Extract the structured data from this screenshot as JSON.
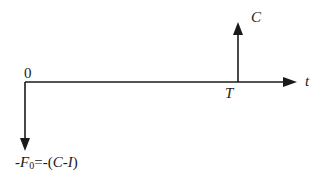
{
  "diagram": {
    "type": "cash-flow-timeline",
    "axis": {
      "origin_label": "0",
      "end_label": "t"
    },
    "inflow": {
      "label": "C",
      "time_label": "T",
      "direction": "up"
    },
    "outflow": {
      "direction": "down",
      "label_prefix": "-",
      "label_var": "F",
      "label_sub": "0",
      "label_rest": "=-(",
      "label_c": "C",
      "label_dash": "-",
      "label_i": "I",
      "label_close": ")"
    },
    "colors": {
      "line": "#1a1a1a",
      "background": "#ffffff"
    }
  }
}
